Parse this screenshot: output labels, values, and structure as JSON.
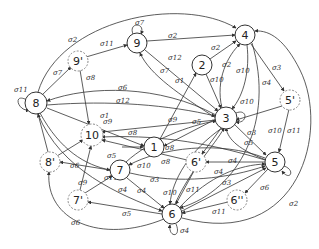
{
  "diagram": {
    "type": "state-transition-graph",
    "nodes": [
      {
        "id": "1",
        "label": "1",
        "x": 154,
        "y": 147,
        "dashed": false
      },
      {
        "id": "2",
        "label": "2",
        "x": 202,
        "y": 65,
        "dashed": false
      },
      {
        "id": "3",
        "label": "3",
        "x": 226,
        "y": 118,
        "dashed": false
      },
      {
        "id": "4",
        "label": "4",
        "x": 245,
        "y": 35,
        "dashed": false
      },
      {
        "id": "5",
        "label": "5",
        "x": 275,
        "y": 162,
        "dashed": false
      },
      {
        "id": "5p",
        "label": "5'",
        "x": 290,
        "y": 100,
        "dashed": true
      },
      {
        "id": "6",
        "label": "6",
        "x": 172,
        "y": 214,
        "dashed": false
      },
      {
        "id": "6p",
        "label": "6'",
        "x": 196,
        "y": 162,
        "dashed": true
      },
      {
        "id": "6pp",
        "label": "6''",
        "x": 237,
        "y": 200,
        "dashed": true
      },
      {
        "id": "7",
        "label": "7",
        "x": 120,
        "y": 170,
        "dashed": false
      },
      {
        "id": "7p",
        "label": "7'",
        "x": 78,
        "y": 200,
        "dashed": true
      },
      {
        "id": "8",
        "label": "8",
        "x": 36,
        "y": 103,
        "dashed": false
      },
      {
        "id": "8p",
        "label": "8'",
        "x": 50,
        "y": 162,
        "dashed": true
      },
      {
        "id": "9",
        "label": "9",
        "x": 137,
        "y": 43,
        "dashed": false
      },
      {
        "id": "9p",
        "label": "9'",
        "x": 78,
        "y": 61,
        "dashed": true
      },
      {
        "id": "10",
        "label": "10",
        "x": 92,
        "y": 135,
        "dashed": true
      }
    ],
    "edge_labels": [
      {
        "text": "σ2",
        "x": 68,
        "y": 42
      },
      {
        "text": "σ11",
        "x": 100,
        "y": 46
      },
      {
        "text": "σ7",
        "x": 135,
        "y": 25
      },
      {
        "text": "σ2",
        "x": 168,
        "y": 38
      },
      {
        "text": "σ7",
        "x": 53,
        "y": 75
      },
      {
        "text": "σ8",
        "x": 86,
        "y": 80
      },
      {
        "text": "σ11",
        "x": 14,
        "y": 92
      },
      {
        "text": "σ6",
        "x": 118,
        "y": 90
      },
      {
        "text": "σ12",
        "x": 116,
        "y": 103
      },
      {
        "text": "σ1",
        "x": 100,
        "y": 118
      },
      {
        "text": "σ12",
        "x": 168,
        "y": 60
      },
      {
        "text": "σ7",
        "x": 160,
        "y": 73
      },
      {
        "text": "σ1",
        "x": 175,
        "y": 83
      },
      {
        "text": "σ2",
        "x": 211,
        "y": 50
      },
      {
        "text": "σ2",
        "x": 222,
        "y": 67
      },
      {
        "text": "σ10",
        "x": 210,
        "y": 82
      },
      {
        "text": "σ10",
        "x": 236,
        "y": 73
      },
      {
        "text": "σ4",
        "x": 262,
        "y": 85
      },
      {
        "text": "σ3",
        "x": 272,
        "y": 70
      },
      {
        "text": "σ10",
        "x": 240,
        "y": 104
      },
      {
        "text": "σ9",
        "x": 168,
        "y": 122
      },
      {
        "text": "σ5",
        "x": 192,
        "y": 124
      },
      {
        "text": "σ9",
        "x": 103,
        "y": 124
      },
      {
        "text": "σ8",
        "x": 128,
        "y": 135
      },
      {
        "text": "σ8",
        "x": 165,
        "y": 150
      },
      {
        "text": "σ8",
        "x": 161,
        "y": 164
      },
      {
        "text": "σ5",
        "x": 107,
        "y": 158
      },
      {
        "text": "σ5",
        "x": 244,
        "y": 145
      },
      {
        "text": "σ3",
        "x": 247,
        "y": 135
      },
      {
        "text": "σ10",
        "x": 268,
        "y": 133
      },
      {
        "text": "σ11",
        "x": 287,
        "y": 133
      },
      {
        "text": "σ4",
        "x": 228,
        "y": 163
      },
      {
        "text": "σ4",
        "x": 214,
        "y": 174
      },
      {
        "text": "σ6",
        "x": 70,
        "y": 168
      },
      {
        "text": "σ10",
        "x": 137,
        "y": 168
      },
      {
        "text": "σ11",
        "x": 104,
        "y": 180
      },
      {
        "text": "σ3",
        "x": 150,
        "y": 182
      },
      {
        "text": "σ9",
        "x": 78,
        "y": 185
      },
      {
        "text": "σ4",
        "x": 118,
        "y": 192
      },
      {
        "text": "σ4",
        "x": 137,
        "y": 193
      },
      {
        "text": "σ10",
        "x": 163,
        "y": 195
      },
      {
        "text": "σ11",
        "x": 186,
        "y": 192
      },
      {
        "text": "σ3",
        "x": 222,
        "y": 185
      },
      {
        "text": "σ6",
        "x": 260,
        "y": 190
      },
      {
        "text": "σ5",
        "x": 122,
        "y": 216
      },
      {
        "text": "σ11",
        "x": 212,
        "y": 214
      },
      {
        "text": "σ2",
        "x": 289,
        "y": 206
      },
      {
        "text": "σ6",
        "x": 71,
        "y": 225
      },
      {
        "text": "σ4",
        "x": 180,
        "y": 233
      }
    ]
  }
}
